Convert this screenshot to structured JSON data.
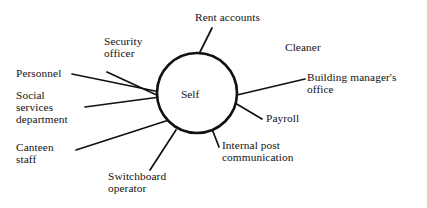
{
  "diagram": {
    "center": {
      "label": "Self",
      "shape": "circle",
      "cx": 197,
      "cy": 93,
      "r": 40,
      "stroke": "#111111",
      "stroke_width": 2.6,
      "fill": "#ffffff",
      "label_x": 181,
      "label_y": 88
    },
    "line_color": "#111111",
    "line_width": 1.7,
    "nodes": [
      {
        "id": "rent-accounts",
        "label": "Rent accounts",
        "lines": [
          "Rent accounts"
        ],
        "x": 195,
        "y": 12,
        "align": "left",
        "connector": {
          "x1": 212,
          "y1": 28,
          "x2": 199,
          "y2": 54
        }
      },
      {
        "id": "security-officer",
        "label": "Security officer",
        "lines": [
          "Security",
          "officer"
        ],
        "x": 104,
        "y": 36,
        "align": "left",
        "connector": {
          "x1": 107,
          "y1": 72,
          "x2": 161,
          "y2": 97
        }
      },
      {
        "id": "cleaner",
        "label": "Cleaner",
        "lines": [
          "Cleaner"
        ],
        "x": 285,
        "y": 42,
        "align": "left",
        "connector": null
      },
      {
        "id": "personnel",
        "label": "Personnel",
        "lines": [
          "Personnel"
        ],
        "x": 16,
        "y": 68,
        "align": "left",
        "connector": {
          "x1": 72,
          "y1": 74,
          "x2": 160,
          "y2": 92
        }
      },
      {
        "id": "building-managers-office",
        "label": "Building manager's office",
        "lines": [
          "Building manager's",
          "office"
        ],
        "x": 307,
        "y": 72,
        "align": "left",
        "connector": {
          "x1": 305,
          "y1": 79,
          "x2": 237,
          "y2": 95
        }
      },
      {
        "id": "social-services-department",
        "label": "Social services department",
        "lines": [
          "Social",
          "services",
          "department"
        ],
        "x": 16,
        "y": 90,
        "align": "left",
        "connector": {
          "x1": 85,
          "y1": 107,
          "x2": 160,
          "y2": 97
        }
      },
      {
        "id": "payroll",
        "label": "Payroll",
        "lines": [
          "Payroll"
        ],
        "x": 266,
        "y": 113,
        "align": "left",
        "connector": {
          "x1": 262,
          "y1": 119,
          "x2": 235,
          "y2": 103
        }
      },
      {
        "id": "canteen-staff",
        "label": "Canteen staff",
        "lines": [
          "Canteen",
          "staff"
        ],
        "x": 16,
        "y": 142,
        "align": "left",
        "connector": {
          "x1": 76,
          "y1": 150,
          "x2": 169,
          "y2": 120
        }
      },
      {
        "id": "internal-post-communication",
        "label": "Internal post communication",
        "lines": [
          "Internal post",
          "communication"
        ],
        "x": 222,
        "y": 140,
        "align": "left",
        "connector": {
          "x1": 219,
          "y1": 147,
          "x2": 212,
          "y2": 129
        }
      },
      {
        "id": "switchboard-operator",
        "label": "Switchboard operator",
        "lines": [
          "Switchboard",
          "operator"
        ],
        "x": 108,
        "y": 171,
        "align": "left",
        "connector": {
          "x1": 150,
          "y1": 170,
          "x2": 176,
          "y2": 130
        }
      }
    ]
  }
}
